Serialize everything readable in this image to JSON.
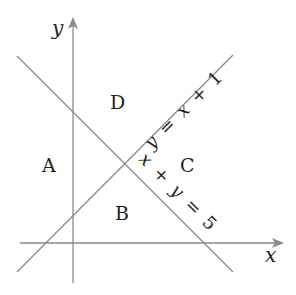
{
  "diagram": {
    "axes": {
      "x_label": "x",
      "y_label": "y",
      "color": "#8a8a8a"
    },
    "lines": [
      {
        "id": "line-1",
        "equation": "y = x + 1",
        "label": "y = x + 1",
        "color": "#8a8a8a"
      },
      {
        "id": "line-2",
        "equation": "x + y = 5",
        "label": "x + y = 5",
        "color": "#8a8a8a"
      }
    ],
    "regions": [
      {
        "id": "A",
        "label": "A"
      },
      {
        "id": "B",
        "label": "B"
      },
      {
        "id": "C",
        "label": "C"
      },
      {
        "id": "D",
        "label": "D"
      }
    ],
    "label_parts": {
      "line1": {
        "y": "y",
        "eq": "=",
        "x": "x",
        "plus": "+",
        "one": "1"
      },
      "line2": {
        "x": "x",
        "plus": "+",
        "y": "y",
        "eq": "=",
        "five": "5"
      }
    }
  }
}
